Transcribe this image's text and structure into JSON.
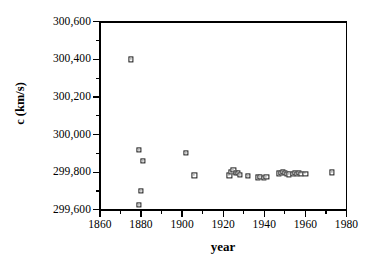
{
  "chart_data": {
    "type": "scatter",
    "title": "",
    "xlabel": "year",
    "ylabel": "c (km/s)",
    "xlim": [
      1860,
      1980
    ],
    "ylim": [
      299600,
      300600
    ],
    "grid": false,
    "legend": null,
    "x_ticks": [
      1860,
      1880,
      1900,
      1920,
      1940,
      1960,
      1980
    ],
    "x_tick_labels": [
      "1860",
      "1880",
      "1900",
      "1920",
      "1940",
      "1960",
      "1980"
    ],
    "x_minor_tick_step": 10,
    "y_ticks": [
      299600,
      299800,
      300000,
      300200,
      300400,
      300600
    ],
    "y_tick_labels": [
      "299,600",
      "299,800",
      "300,000",
      "300,200",
      "300,400",
      "300,600"
    ],
    "y_minor_tick_step": 100,
    "marker": "open-square",
    "marker_color": "#1a1a1a",
    "points": [
      {
        "x": 1875,
        "y": 300400
      },
      {
        "x": 1879,
        "y": 299920
      },
      {
        "x": 1881,
        "y": 299860
      },
      {
        "x": 1880,
        "y": 299700
      },
      {
        "x": 1879,
        "y": 299627
      },
      {
        "x": 1902,
        "y": 299901
      },
      {
        "x": 1906,
        "y": 299783
      },
      {
        "x": 1923,
        "y": 299783
      },
      {
        "x": 1924,
        "y": 299802
      },
      {
        "x": 1925,
        "y": 299812
      },
      {
        "x": 1926,
        "y": 299796
      },
      {
        "x": 1927,
        "y": 299798
      },
      {
        "x": 1928,
        "y": 299786
      },
      {
        "x": 1932,
        "y": 299780
      },
      {
        "x": 1937,
        "y": 299772
      },
      {
        "x": 1938,
        "y": 299774
      },
      {
        "x": 1940,
        "y": 299771
      },
      {
        "x": 1941,
        "y": 299776
      },
      {
        "x": 1947,
        "y": 299794
      },
      {
        "x": 1948,
        "y": 299798
      },
      {
        "x": 1949,
        "y": 299800
      },
      {
        "x": 1950,
        "y": 299797
      },
      {
        "x": 1951,
        "y": 299792
      },
      {
        "x": 1952,
        "y": 299788
      },
      {
        "x": 1954,
        "y": 299793
      },
      {
        "x": 1955,
        "y": 299796
      },
      {
        "x": 1956,
        "y": 299792
      },
      {
        "x": 1957,
        "y": 299795
      },
      {
        "x": 1958,
        "y": 299793
      },
      {
        "x": 1960,
        "y": 299793
      },
      {
        "x": 1973,
        "y": 299799
      }
    ]
  }
}
